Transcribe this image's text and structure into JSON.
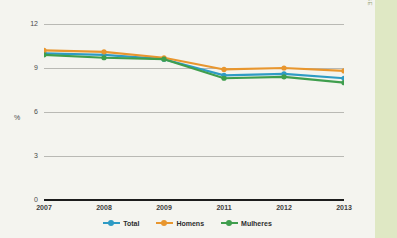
{
  "watermark": "IBGE",
  "chart_data": {
    "type": "line",
    "title": "",
    "xlabel": "",
    "ylabel": "%",
    "ylim": [
      0,
      12
    ],
    "yticks": [
      0,
      3,
      6,
      9,
      12
    ],
    "grid": true,
    "legend_position": "bottom",
    "categories": [
      "2007",
      "2008",
      "2009",
      "2011",
      "2012",
      "2013"
    ],
    "series": [
      {
        "name": "Total",
        "color": "#2e9bc4",
        "values": [
          10.0,
          9.9,
          9.6,
          8.5,
          8.6,
          8.3
        ]
      },
      {
        "name": "Homens",
        "color": "#e8962e",
        "values": [
          10.2,
          10.1,
          9.7,
          8.9,
          9.0,
          8.8
        ]
      },
      {
        "name": "Mulheres",
        "color": "#3f9e4d",
        "values": [
          9.9,
          9.7,
          9.6,
          8.3,
          8.4,
          8.0
        ]
      }
    ]
  }
}
